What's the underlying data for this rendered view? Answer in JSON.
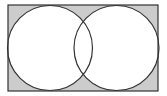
{
  "diagram": {
    "type": "venn",
    "universe": {
      "label": "",
      "shaded": "outside-both-sets"
    },
    "sets": [
      {
        "name": "A",
        "label": ""
      },
      {
        "name": "B",
        "label": ""
      }
    ],
    "shaded_region": "complement of A union B",
    "colors": {
      "shade": "#cccccc",
      "stroke": "#333333",
      "background": "#ffffff"
    }
  }
}
